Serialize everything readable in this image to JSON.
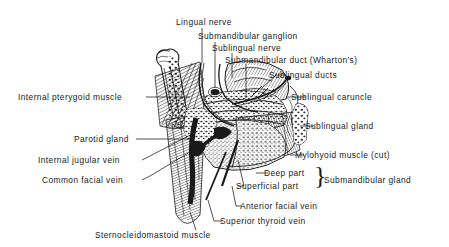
{
  "figure": {
    "kind": "anatomical-line-illustration",
    "style": "black-and-white engraving with hatching and stippling",
    "background_color": "#ffffff",
    "ink_color": "#1a1a1a"
  },
  "labels": {
    "lingual_nerve": "Lingual nerve",
    "submandibular_ganglion": "Submandibular ganglion",
    "sublingual_nerve": "Sublingual nerve",
    "submandibular_duct": "Submandibular duct (Wharton's)",
    "sublingual_ducts": "Sublingual ducts",
    "sublingual_caruncle": "Sublingual caruncle",
    "sublingual_gland": "Sublingual gland",
    "mylohyoid_muscle": "Mylohyoid muscle (cut)",
    "internal_pterygoid_muscle": "Internal pterygoid muscle",
    "parotid_gland": "Parotid gland",
    "internal_jugular_vein": "Internal jugular vein",
    "common_facial_vein": "Common facial vein",
    "deep_part": "Deep part",
    "superficial_part": "Superficial part",
    "submandibular_gland": "Submandibular gland",
    "anterior_facial_vein": "Anterior facial vein",
    "superior_thyroid_vein": "Superior thyroid vein",
    "sternocleidomastoid_muscle": "Sternocleidomastoid muscle",
    "brace_glyph": "}"
  }
}
